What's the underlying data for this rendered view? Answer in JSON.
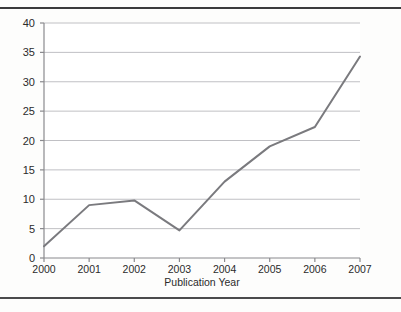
{
  "figure": {
    "background_color": "#fdfdfc",
    "frame_color": "#3a3a3c"
  },
  "chart_data": {
    "type": "line",
    "title": "",
    "subtitle": "",
    "xlabel": "Publication Year",
    "ylabel": "",
    "categories": [
      "2000",
      "2001",
      "2002",
      "2003",
      "2004",
      "2005",
      "2006",
      "2007"
    ],
    "values": [
      2,
      9,
      9.8,
      4.7,
      13,
      19,
      22.3,
      34.3
    ],
    "series": [
      {
        "name": "Publications",
        "values": [
          2,
          9,
          9.8,
          4.7,
          13,
          19,
          22.3,
          34.3
        ],
        "color": "#7a7a7e"
      }
    ],
    "xlim": [
      2000,
      2007
    ],
    "ylim": [
      0,
      40
    ],
    "ytick_values": [
      0,
      5,
      10,
      15,
      20,
      25,
      30,
      35,
      40
    ],
    "ytick_labels": [
      "0",
      "5",
      "10",
      "15",
      "20",
      "25",
      "30",
      "35",
      "40"
    ],
    "xtick_labels": [
      "2000",
      "2001",
      "2002",
      "2003",
      "2004",
      "2005",
      "2006",
      "2007"
    ],
    "grid": "horizontal",
    "grid_color": "#b9b9bd",
    "legend": "none",
    "legend_position": "none",
    "annotations": []
  },
  "axes": {
    "y_axis_line_color": "#8a8a8e",
    "x_axis_line_color": "#8a8a8e",
    "line_color": "#7a7a7e",
    "line_width": 2
  }
}
